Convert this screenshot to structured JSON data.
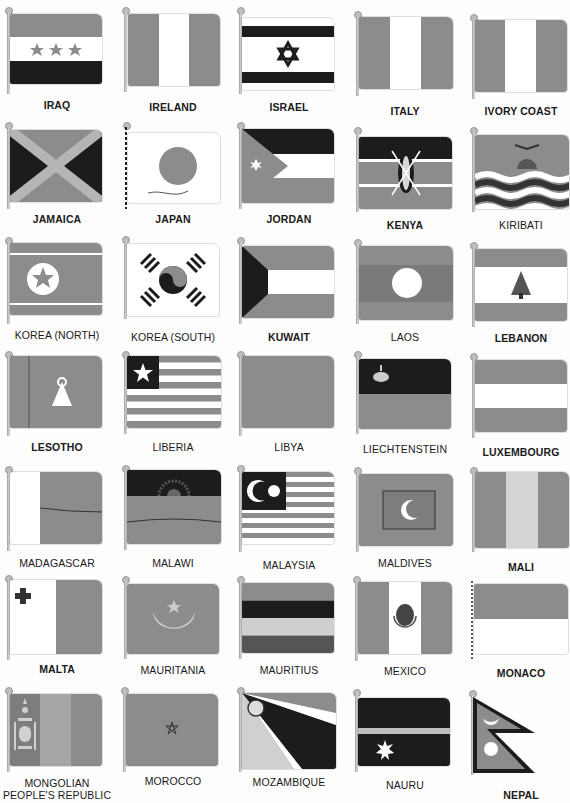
{
  "page": {
    "palette": {
      "gray": "#8c8c8c",
      "dark": "#1c1c1c",
      "white": "#ffffff",
      "mid": "#a6a6a6",
      "light": "#c8c8c8"
    },
    "flags": [
      {
        "name": "IRAQ",
        "row": 0,
        "col": 0
      },
      {
        "name": "IRELAND",
        "row": 0,
        "col": 1
      },
      {
        "name": "ISRAEL",
        "row": 0,
        "col": 2
      },
      {
        "name": "ITALY",
        "row": 0,
        "col": 3
      },
      {
        "name": "IVORY COAST",
        "row": 0,
        "col": 4
      },
      {
        "name": "JAMAICA",
        "row": 1,
        "col": 0
      },
      {
        "name": "JAPAN",
        "row": 1,
        "col": 1
      },
      {
        "name": "JORDAN",
        "row": 1,
        "col": 2
      },
      {
        "name": "KENYA",
        "row": 1,
        "col": 3
      },
      {
        "name": "KIRIBATI",
        "row": 1,
        "col": 4
      },
      {
        "name": "KOREA (NORTH)",
        "row": 2,
        "col": 0
      },
      {
        "name": "KOREA (SOUTH)",
        "row": 2,
        "col": 1
      },
      {
        "name": "KUWAIT",
        "row": 2,
        "col": 2
      },
      {
        "name": "LAOS",
        "row": 2,
        "col": 3
      },
      {
        "name": "LEBANON",
        "row": 2,
        "col": 4
      },
      {
        "name": "LESOTHO",
        "row": 3,
        "col": 0
      },
      {
        "name": "LIBERIA",
        "row": 3,
        "col": 1
      },
      {
        "name": "LIBYA",
        "row": 3,
        "col": 2
      },
      {
        "name": "LIECHTENSTEIN",
        "row": 3,
        "col": 3
      },
      {
        "name": "LUXEMBOURG",
        "row": 3,
        "col": 4
      },
      {
        "name": "MADAGASCAR",
        "row": 4,
        "col": 0
      },
      {
        "name": "MALAWI",
        "row": 4,
        "col": 1
      },
      {
        "name": "MALAYSIA",
        "row": 4,
        "col": 2
      },
      {
        "name": "MALDIVES",
        "row": 4,
        "col": 3
      },
      {
        "name": "MALI",
        "row": 4,
        "col": 4
      },
      {
        "name": "MALTA",
        "row": 5,
        "col": 0
      },
      {
        "name": "MAURITANIA",
        "row": 5,
        "col": 1
      },
      {
        "name": "MAURITIUS",
        "row": 5,
        "col": 2
      },
      {
        "name": "MEXICO",
        "row": 5,
        "col": 3
      },
      {
        "name": "MONACO",
        "row": 5,
        "col": 4
      },
      {
        "name": "MONGOLIAN PEOPLE'S REPUBLIC",
        "row": 6,
        "col": 0
      },
      {
        "name": "MOROCCO",
        "row": 6,
        "col": 1
      },
      {
        "name": "MOZAMBIQUE",
        "row": 6,
        "col": 2
      },
      {
        "name": "NAURU",
        "row": 6,
        "col": 3
      },
      {
        "name": "NEPAL",
        "row": 6,
        "col": 4
      }
    ]
  }
}
